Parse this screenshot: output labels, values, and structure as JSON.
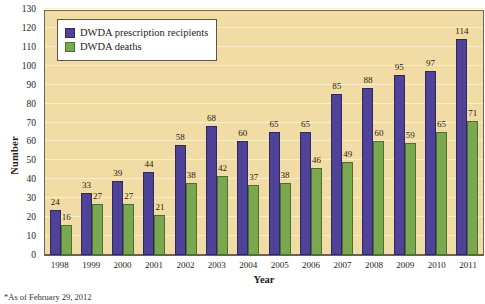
{
  "chart_data": {
    "type": "bar",
    "title": "",
    "xlabel": "Year",
    "ylabel": "Number",
    "ylim": [
      0,
      130
    ],
    "ytick_step": 10,
    "grid": true,
    "legend_position": "top-left",
    "categories": [
      "1998",
      "1999",
      "2000",
      "2001",
      "2002",
      "2003",
      "2004",
      "2005",
      "2006",
      "2007",
      "2008",
      "2009",
      "2010",
      "2011"
    ],
    "series": [
      {
        "name": "DWDA prescription recipients",
        "color": "#4e4398",
        "values": [
          24,
          33,
          39,
          44,
          58,
          68,
          60,
          65,
          65,
          85,
          88,
          95,
          97,
          114
        ]
      },
      {
        "name": "DWDA deaths",
        "color": "#7aa850",
        "values": [
          16,
          27,
          27,
          21,
          38,
          42,
          37,
          38,
          46,
          49,
          60,
          59,
          65,
          71
        ]
      }
    ],
    "ytick_labels": [
      "0",
      "10",
      "20",
      "30",
      "40",
      "50",
      "60",
      "70",
      "80",
      "90",
      "100",
      "110",
      "120",
      "130"
    ],
    "annotations": [
      "*As of February 29, 2012"
    ]
  },
  "axes": {
    "y_title": "Number",
    "x_title": "Year"
  },
  "legend": {
    "entries": [
      {
        "label": "DWDA prescription recipients",
        "swatch": "purple-swatch"
      },
      {
        "label": "DWDA deaths",
        "swatch": "green-swatch"
      }
    ]
  },
  "footnote": {
    "text": "*As of February 29, 2012"
  },
  "colors": {
    "plot_background": "#f2dca5",
    "gridline": "#fbeec6",
    "axis": "#6c6350",
    "series_recipients": "#4e4398",
    "series_deaths": "#7aa850"
  }
}
